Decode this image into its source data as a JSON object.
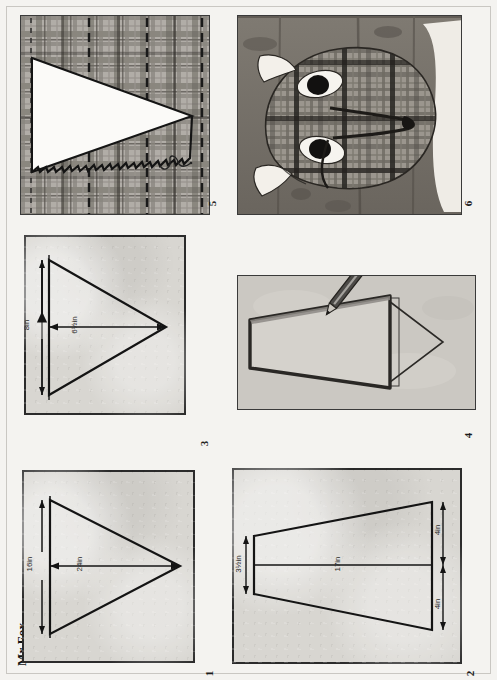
{
  "page": {
    "title": "Mr Fox",
    "background_color": "#f4f3f0",
    "panel_fill_color": "#d8d6d1",
    "ink_color": "#1a1a1a",
    "orientation_note": "page scanned sideways; all text rotated 90 degrees counter-clockwise"
  },
  "panels": [
    {
      "number": "1",
      "name": "body-pattern-diagram",
      "kind": "line-drawing",
      "caption": "",
      "dimensions": [
        {
          "value": "16in",
          "axis": "vertical",
          "name": "body-height"
        },
        {
          "value": "24in",
          "axis": "horizontal",
          "name": "body-length"
        }
      ]
    },
    {
      "number": "2",
      "name": "tail-pattern-diagram",
      "kind": "line-drawing",
      "caption": "",
      "dimensions": [
        {
          "value": "3½in",
          "axis": "vertical",
          "name": "tail-narrow-end"
        },
        {
          "value": "17in",
          "axis": "horizontal",
          "name": "tail-length"
        },
        {
          "value": "4in",
          "axis": "vertical",
          "name": "tail-wide-upper"
        },
        {
          "value": "4in",
          "axis": "vertical",
          "name": "tail-wide-lower"
        }
      ]
    },
    {
      "number": "3",
      "name": "ear-pattern-diagram",
      "kind": "line-drawing",
      "caption": "",
      "dimensions": [
        {
          "value": "8in",
          "axis": "vertical",
          "name": "ear-height"
        },
        {
          "value": "6½in",
          "axis": "horizontal",
          "name": "ear-length"
        }
      ]
    },
    {
      "number": "4",
      "name": "tracing-template-photo",
      "kind": "photo",
      "caption": "",
      "dimensions": []
    },
    {
      "number": "5",
      "name": "plaid-fabric-cut-piece",
      "kind": "photo",
      "caption": "",
      "dimensions": []
    },
    {
      "number": "6",
      "name": "finished-fox-head-photo",
      "kind": "photo",
      "caption": "",
      "dimensions": []
    }
  ]
}
